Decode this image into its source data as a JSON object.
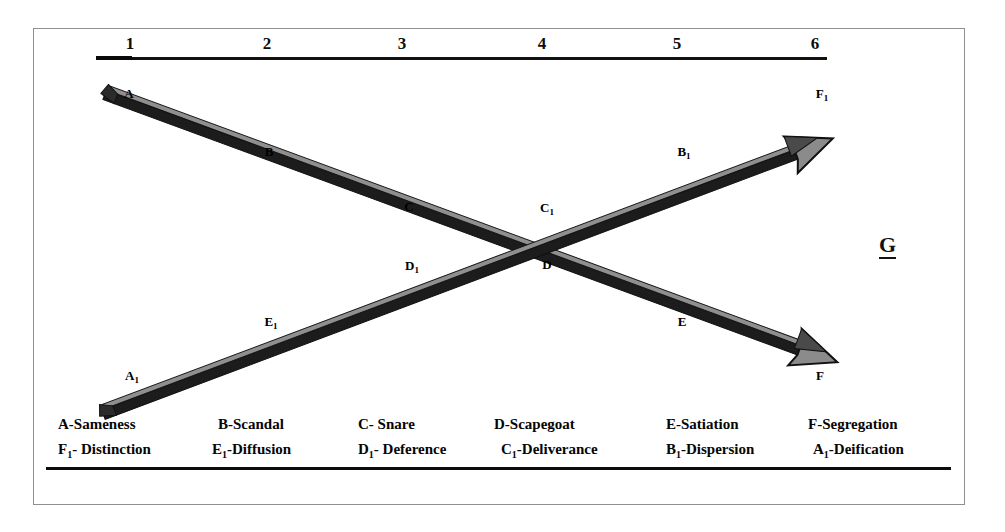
{
  "diagram": {
    "title_marker": "G",
    "scale": {
      "ticks": [
        "1",
        "2",
        "3",
        "4",
        "5",
        "6"
      ]
    },
    "arrows": [
      {
        "name": "descending-arrow",
        "direction": "down-right",
        "nodes": [
          "A",
          "B",
          "C",
          "D",
          "E",
          "F"
        ]
      },
      {
        "name": "ascending-arrow",
        "direction": "up-right",
        "nodes": [
          "A1",
          "B1",
          "C1",
          "D1",
          "E1",
          "F1"
        ]
      }
    ],
    "node_labels": {
      "a": "A",
      "b": "B",
      "c": "C",
      "d": "D",
      "e": "E",
      "f": "F",
      "a1_letter": "A",
      "a1_sub": "1",
      "b1_letter": "B",
      "b1_sub": "1",
      "c1_letter": "C",
      "c1_sub": "1",
      "d1_letter": "D",
      "d1_sub": "1",
      "e1_letter": "E",
      "e1_sub": "1",
      "f1_letter": "F",
      "f1_sub": "1"
    },
    "legend": {
      "row1": [
        {
          "label": "A-Sameness"
        },
        {
          "label": "B-Scandal"
        },
        {
          "label": "C- Snare"
        },
        {
          "label": "D-Scapegoat"
        },
        {
          "label": "E-Satiation"
        },
        {
          "label": "F-Segregation"
        }
      ],
      "row2": [
        {
          "letter": "F",
          "sub": "1",
          "rest": "- Distinction"
        },
        {
          "letter": "E",
          "sub": "1",
          "rest": "-Diffusion"
        },
        {
          "letter": "D",
          "sub": "1",
          "rest": "- Deference"
        },
        {
          "letter": "C",
          "sub": "1",
          "rest": "-Deliverance"
        },
        {
          "letter": "B",
          "sub": "1",
          "rest": "-Dispersion"
        },
        {
          "letter": "A",
          "sub": "1",
          "rest": "-Deification"
        }
      ]
    },
    "colors": {
      "arrow_outline": "#1a1a1a",
      "arrow_fill": "#8a8a8a",
      "rule": "#0c0c0c",
      "frame": "#8f8f8f",
      "text": "#050505"
    }
  }
}
